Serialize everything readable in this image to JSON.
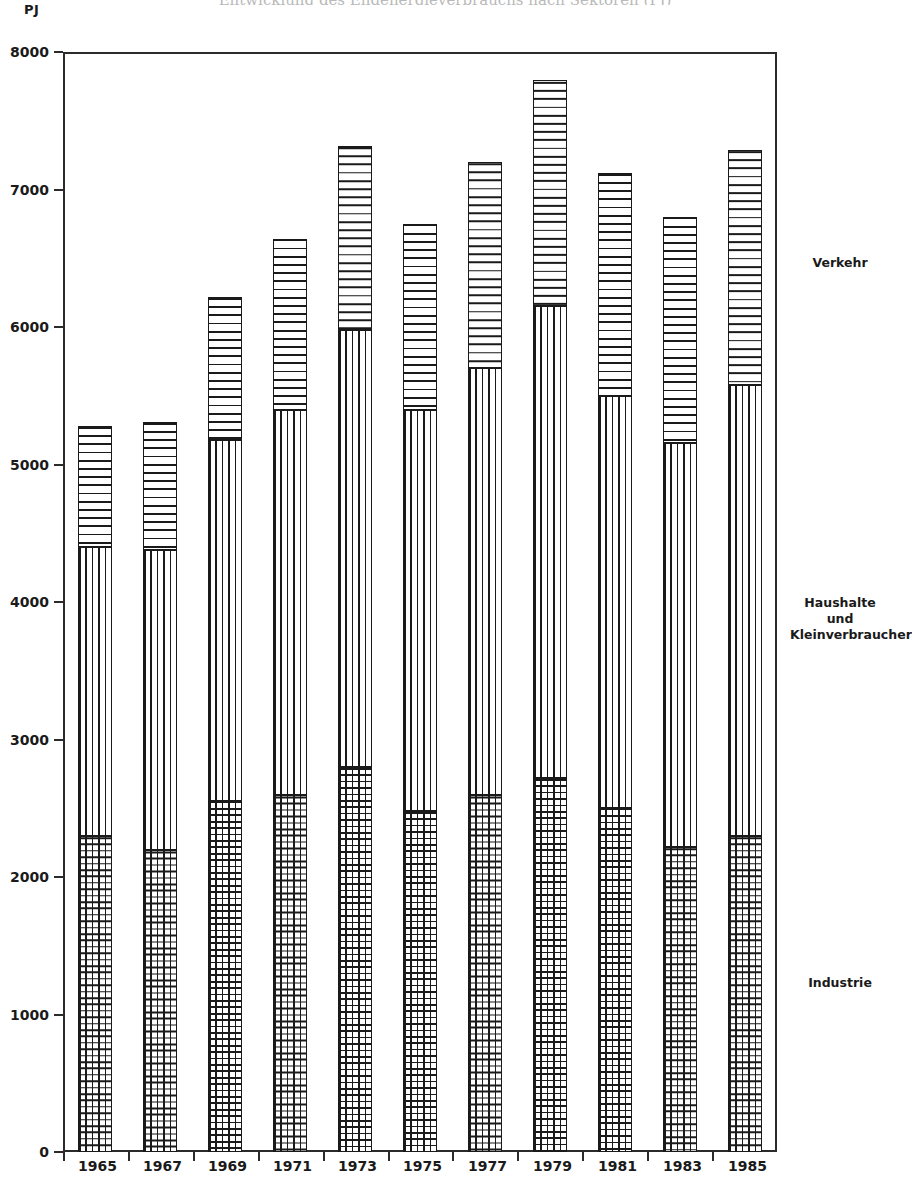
{
  "title": "Entwicklung des Endenergieverbrauchs nach Sektoren (PJ)",
  "unit_label": "PJ",
  "axes": {
    "y_ticks": [
      "8000",
      "7000",
      "6000",
      "5000",
      "4000",
      "3000",
      "2000",
      "1000",
      "0"
    ],
    "x_ticks": [
      "1965",
      "1967",
      "1969",
      "1971",
      "1973",
      "1975",
      "1977",
      "1979",
      "1981",
      "1983",
      "1985"
    ]
  },
  "legend": [
    {
      "label": "Verkehr",
      "pattern": "horizontal-stripes"
    },
    {
      "label": "Haushalte und\nKleinverbraucher",
      "pattern": "vertical-stripes"
    },
    {
      "label": "Industrie",
      "pattern": "cross-hatch-grid"
    }
  ],
  "chart_data": {
    "type": "bar",
    "stacked": true,
    "title": "Entwicklung des Endenergieverbrauchs nach Sektoren (PJ)",
    "xlabel": "",
    "ylabel": "PJ",
    "ylim": [
      0,
      8000
    ],
    "y_tick_step": 1000,
    "grid": false,
    "legend_position": "right",
    "categories": [
      "1965",
      "1967",
      "1969",
      "1971",
      "1973",
      "1975",
      "1977",
      "1979",
      "1981",
      "1983",
      "1985"
    ],
    "series": [
      {
        "name": "Industrie",
        "pattern": "cross-hatch-grid",
        "values": [
          2300,
          2200,
          2550,
          2600,
          2800,
          2480,
          2600,
          2720,
          2500,
          2220,
          2300
        ]
      },
      {
        "name": "Haushalte und Kleinverbraucher",
        "pattern": "vertical-stripes",
        "values": [
          2100,
          2180,
          2630,
          2800,
          3180,
          2920,
          3100,
          3430,
          3000,
          2940,
          3280
        ]
      },
      {
        "name": "Verkehr",
        "pattern": "horizontal-stripes",
        "values": [
          880,
          930,
          1040,
          1240,
          1340,
          1350,
          1500,
          1650,
          1620,
          1640,
          1710
        ]
      }
    ],
    "cumulative_tops": {
      "industrie": [
        2300,
        2200,
        2550,
        2600,
        2800,
        2480,
        2600,
        2720,
        2500,
        2220,
        2300
      ],
      "haushalte": [
        4400,
        4380,
        5180,
        5400,
        5980,
        5400,
        5700,
        6150,
        5500,
        5160,
        5580
      ],
      "verkehr": [
        5280,
        5310,
        6220,
        6640,
        7320,
        6750,
        7200,
        7800,
        7120,
        6800,
        7290
      ]
    },
    "totals": [
      5280,
      5310,
      6220,
      6640,
      7320,
      6750,
      7200,
      7800,
      7120,
      6800,
      7290
    ]
  }
}
